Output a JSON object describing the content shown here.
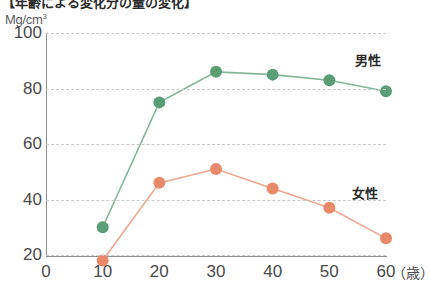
{
  "title": "【年齢による変化分の量の変化】",
  "axis": {
    "y_unit": "Mg/cm",
    "y_unit_sup": "3",
    "x_unit": "（歳）",
    "y_ticks": [
      "20",
      "40",
      "60",
      "80",
      "100"
    ],
    "x_ticks": [
      "0",
      "10",
      "20",
      "30",
      "40",
      "50",
      "60"
    ]
  },
  "legend": {
    "male": "男性",
    "female": "女性"
  },
  "colors": {
    "male": "#5A9E78",
    "female": "#E8896A",
    "grid": "#C9C9C9",
    "axis": "#8E8E8E",
    "text": "#4A4A4A",
    "background": "#FFFFFF"
  },
  "chart_data": {
    "type": "line",
    "title": "【年齢による変化分の量の変化】",
    "xlabel": "（歳）",
    "ylabel": "Mg/cm3",
    "xlim": [
      0,
      60
    ],
    "ylim": [
      20,
      100
    ],
    "grid": true,
    "legend_position": "inline-right",
    "x": [
      10,
      20,
      30,
      40,
      50,
      60
    ],
    "series": [
      {
        "name": "男性",
        "color": "#5A9E78",
        "values": [
          30,
          75,
          86,
          85,
          83,
          79
        ]
      },
      {
        "name": "女性",
        "color": "#E8896A",
        "values": [
          18,
          46,
          51,
          44,
          37,
          26
        ]
      }
    ]
  }
}
